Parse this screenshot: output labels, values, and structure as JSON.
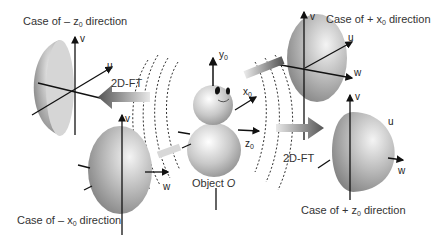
{
  "diagram": {
    "object_label": "Object",
    "object_symbol": "O",
    "transform_label": "2D-FT",
    "object_axes": {
      "y": "y",
      "x": "x",
      "z": "z",
      "subscript": "0"
    },
    "frequency_axes": {
      "u": "u",
      "v": "v",
      "w": "w"
    },
    "cases": [
      {
        "id": "minus-z0",
        "prefix": "Case of – z",
        "sub": "0",
        "suffix": " direction"
      },
      {
        "id": "minus-x0",
        "prefix": "Case of – x",
        "sub": "0",
        "suffix": " direction"
      },
      {
        "id": "plus-x0",
        "prefix": "Case of + x",
        "sub": "0",
        "suffix": " direction"
      },
      {
        "id": "plus-z0",
        "prefix": "Case of + z",
        "sub": "0",
        "suffix": " direction"
      }
    ]
  }
}
